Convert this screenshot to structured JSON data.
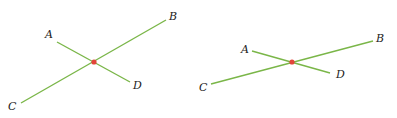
{
  "colors": {
    "line": "#7ab648",
    "point": "#e2453a",
    "label": "#222222",
    "background": "#ffffff"
  },
  "figures": [
    {
      "name": "left-figure",
      "segments": [
        {
          "from": "A",
          "to": "D"
        },
        {
          "from": "C",
          "to": "B"
        }
      ],
      "labels": {
        "A": "A",
        "B": "B",
        "C": "C",
        "D": "D"
      },
      "intersection_marked": true
    },
    {
      "name": "right-figure",
      "segments": [
        {
          "from": "A",
          "to": "D"
        },
        {
          "from": "C",
          "to": "B"
        }
      ],
      "labels": {
        "A": "A",
        "B": "B",
        "C": "C",
        "D": "D"
      },
      "intersection_marked": true
    }
  ]
}
